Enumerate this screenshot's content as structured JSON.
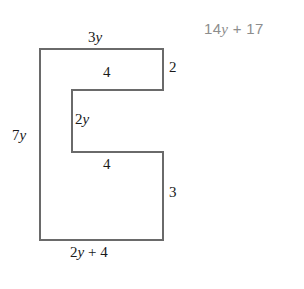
{
  "figure": {
    "name": "c-shaped-polygon",
    "stroke_color": "#6a6a6a",
    "fill_color": "#ffffff",
    "stroke_width": 2,
    "vertices": [
      [
        40,
        49
      ],
      [
        163,
        49
      ],
      [
        163,
        90
      ],
      [
        72,
        90
      ],
      [
        72,
        152
      ],
      [
        163,
        152
      ],
      [
        163,
        240
      ],
      [
        40,
        240
      ]
    ],
    "path": "M 40 49 L 163 49 L 163 90 L 72 90 L 72 152 L 163 152 L 163 240 L 40 240 Z"
  },
  "labels": {
    "top": {
      "coefficient": "3",
      "variable": "y"
    },
    "right_top": {
      "value": "2"
    },
    "notch_top": {
      "value": "4"
    },
    "inner_left": {
      "coefficient": "2",
      "variable": "y"
    },
    "left": {
      "coefficient": "7",
      "variable": "y"
    },
    "notch_bottom": {
      "value": "4"
    },
    "right_bottom": {
      "value": "3"
    },
    "bottom": {
      "coefficient": "2",
      "variable": "y",
      "suffix": " + 4"
    }
  },
  "answer": {
    "coefficient": "14",
    "variable": "y",
    "suffix": " + 17",
    "color": "#8d8d8d"
  },
  "chart_data": {
    "type": "diagram",
    "title": "",
    "shape": "C-shaped polygon (rectilinear)",
    "side_lengths": [
      {
        "side": "top",
        "label": "3y",
        "orientation": "horizontal"
      },
      {
        "side": "right-upper",
        "label": "2",
        "orientation": "vertical"
      },
      {
        "side": "notch-upper",
        "label": "4",
        "orientation": "horizontal"
      },
      {
        "side": "inner-left",
        "label": "2y",
        "orientation": "vertical"
      },
      {
        "side": "notch-lower",
        "label": "4",
        "orientation": "horizontal"
      },
      {
        "side": "right-lower",
        "label": "3",
        "orientation": "vertical"
      },
      {
        "side": "bottom",
        "label": "2y + 4",
        "orientation": "horizontal"
      },
      {
        "side": "left",
        "label": "7y",
        "orientation": "vertical"
      }
    ],
    "perimeter_expression": "14y + 17"
  }
}
